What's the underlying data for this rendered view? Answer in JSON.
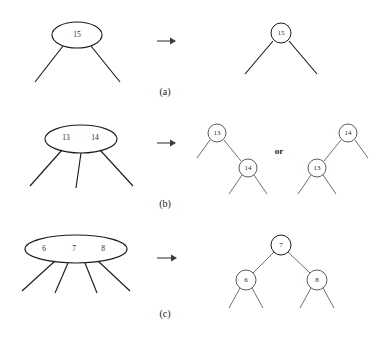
{
  "figure": {
    "background_color": "#ffffff",
    "ink_color": "#1c1c1c",
    "node_stroke_color": "#4a4a4a",
    "width": 385,
    "height": 341,
    "or_label": "or",
    "arrow_glyph": "→"
  },
  "panels": [
    {
      "id": "a",
      "caption": "(a)",
      "caption_x": 165,
      "caption_y": 93,
      "arrow": {
        "x1": 157,
        "y1": 41,
        "x2": 174,
        "y2": 41
      },
      "left": {
        "shape": "ellipse",
        "cx": 77,
        "cy": 35,
        "rx": 25,
        "ry": 13,
        "keys": [
          {
            "label": "15",
            "x": 77,
            "y": 35
          }
        ],
        "edges": [
          {
            "x1": 63,
            "y1": 46,
            "x2": 35,
            "y2": 82
          },
          {
            "x1": 91,
            "y1": 46,
            "x2": 120,
            "y2": 82
          }
        ]
      },
      "right": {
        "nodes": [
          {
            "label": "15",
            "cx": 281,
            "cy": 33,
            "r": 10
          }
        ],
        "links": [],
        "stubs": [
          {
            "x1": 273,
            "y1": 41,
            "x2": 245,
            "y2": 74
          },
          {
            "x1": 289,
            "y1": 41,
            "x2": 317,
            "y2": 74
          }
        ]
      }
    },
    {
      "id": "b",
      "caption": "(b)",
      "caption_x": 165,
      "caption_y": 205,
      "arrow": {
        "x1": 157,
        "y1": 143,
        "x2": 174,
        "y2": 143
      },
      "left": {
        "shape": "ellipse",
        "cx": 81,
        "cy": 139,
        "rx": 36,
        "ry": 14,
        "keys": [
          {
            "label": "13",
            "x": 66,
            "y": 138
          },
          {
            "label": "14",
            "x": 95,
            "y": 138
          }
        ],
        "edges": [
          {
            "x1": 62,
            "y1": 150,
            "x2": 30,
            "y2": 186
          },
          {
            "x1": 81,
            "y1": 153,
            "x2": 76,
            "y2": 188
          },
          {
            "x1": 100,
            "y1": 150,
            "x2": 133,
            "y2": 186
          }
        ]
      },
      "right_variant_1": {
        "nodes": [
          {
            "label": "13",
            "cx": 217,
            "cy": 133,
            "r": 9
          },
          {
            "label": "14",
            "cx": 248,
            "cy": 168,
            "r": 9
          }
        ],
        "links": [
          {
            "x1": 224,
            "y1": 140,
            "x2": 241,
            "y2": 161
          }
        ],
        "stubs": [
          {
            "x1": 210,
            "y1": 140,
            "x2": 197,
            "y2": 158
          },
          {
            "x1": 242,
            "y1": 175,
            "x2": 229,
            "y2": 194
          },
          {
            "x1": 254,
            "y1": 175,
            "x2": 267,
            "y2": 194
          }
        ]
      },
      "or_x": 279,
      "or_y": 152,
      "right_variant_2": {
        "nodes": [
          {
            "label": "14",
            "cx": 348,
            "cy": 133,
            "r": 9
          },
          {
            "label": "13",
            "cx": 317,
            "cy": 168,
            "r": 9
          }
        ],
        "links": [
          {
            "x1": 341,
            "y1": 140,
            "x2": 324,
            "y2": 161
          }
        ],
        "stubs": [
          {
            "x1": 355,
            "y1": 140,
            "x2": 368,
            "y2": 158
          },
          {
            "x1": 311,
            "y1": 175,
            "x2": 298,
            "y2": 194
          },
          {
            "x1": 323,
            "y1": 175,
            "x2": 336,
            "y2": 194
          }
        ]
      }
    },
    {
      "id": "c",
      "caption": "(c)",
      "caption_x": 165,
      "caption_y": 315,
      "arrow": {
        "x1": 157,
        "y1": 258,
        "x2": 176,
        "y2": 258
      },
      "left": {
        "shape": "ellipse",
        "cx": 76,
        "cy": 249,
        "rx": 51,
        "ry": 14,
        "keys": [
          {
            "label": "6",
            "x": 44,
            "y": 249
          },
          {
            "label": "7",
            "x": 74,
            "y": 249
          },
          {
            "label": "8",
            "x": 103,
            "y": 249
          }
        ],
        "edges": [
          {
            "x1": 55,
            "y1": 261,
            "x2": 22,
            "y2": 291
          },
          {
            "x1": 68,
            "y1": 263,
            "x2": 55,
            "y2": 293
          },
          {
            "x1": 85,
            "y1": 263,
            "x2": 97,
            "y2": 293
          },
          {
            "x1": 98,
            "y1": 261,
            "x2": 130,
            "y2": 291
          }
        ]
      },
      "right": {
        "nodes": [
          {
            "label": "7",
            "cx": 281,
            "cy": 245,
            "r": 10
          },
          {
            "label": "6",
            "cx": 246,
            "cy": 280,
            "r": 10
          },
          {
            "label": "8",
            "cx": 317,
            "cy": 280,
            "r": 10
          }
        ],
        "links": [
          {
            "x1": 274,
            "y1": 252,
            "x2": 253,
            "y2": 273
          },
          {
            "x1": 288,
            "y1": 252,
            "x2": 310,
            "y2": 273
          }
        ],
        "stubs": [
          {
            "x1": 240,
            "y1": 288,
            "x2": 229,
            "y2": 308
          },
          {
            "x1": 252,
            "y1": 288,
            "x2": 263,
            "y2": 308
          },
          {
            "x1": 311,
            "y1": 288,
            "x2": 300,
            "y2": 308
          },
          {
            "x1": 323,
            "y1": 288,
            "x2": 334,
            "y2": 308
          }
        ]
      }
    }
  ]
}
